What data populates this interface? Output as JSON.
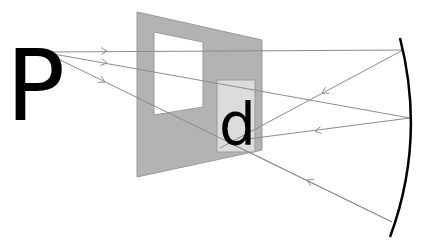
{
  "diagram": {
    "type": "optics-reflection",
    "object_label": "P",
    "image_label": "d",
    "colors": {
      "background": "#ffffff",
      "panel": "#b3b3b3",
      "panel_edge": "#999999",
      "window": "#ffffff",
      "image_box": "#dcdcdc",
      "ray": "#8c8c8c",
      "mirror": "#000000",
      "text": "#000000"
    },
    "panel": {
      "points": "137,12 262,40 262,150 137,177"
    },
    "window": {
      "points": "154,32 203,42 203,107 154,115"
    },
    "image_box": {
      "x": 217,
      "y": 80,
      "width": 38,
      "height": 72
    },
    "mirror": {
      "path": "M400,38 Q426,140 390,237"
    },
    "rays": [
      {
        "name": "ray-top-incident",
        "x1": 48,
        "y1": 52,
        "x2": 403,
        "y2": 50,
        "arrow_at": [
          107,
          51
        ],
        "direction": "right"
      },
      {
        "name": "ray-middle-incident",
        "x1": 48,
        "y1": 53,
        "x2": 410,
        "y2": 118,
        "arrow_at": [
          107,
          63
        ],
        "direction": "right"
      },
      {
        "name": "ray-bottom-incident",
        "x1": 48,
        "y1": 54,
        "x2": 392,
        "y2": 222,
        "arrow_at": [
          105,
          82
        ],
        "direction": "right"
      },
      {
        "name": "ray-top-reflected",
        "x1": 403,
        "y1": 50,
        "x2": 220,
        "y2": 148,
        "arrow_at": [
          322,
          93
        ],
        "direction": "left"
      },
      {
        "name": "ray-middle-reflected",
        "x1": 410,
        "y1": 118,
        "x2": 240,
        "y2": 140,
        "arrow_at": [
          315,
          131
        ],
        "direction": "left"
      },
      {
        "name": "ray-bottom-reflected",
        "x1": 392,
        "y1": 222,
        "x2": 230,
        "y2": 143,
        "arrow_at": [
          307,
          180
        ],
        "direction": "left"
      }
    ]
  }
}
